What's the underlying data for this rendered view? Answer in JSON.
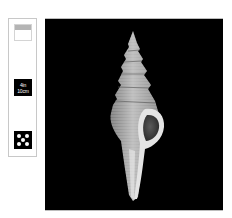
{
  "sidebar": {
    "items": [
      {
        "name": "view-thumbnail",
        "label": "",
        "icon": "image-view-icon"
      },
      {
        "name": "scale-toggle",
        "label_line1": "4in",
        "label_line2": "10cm",
        "icon": "scale-icon"
      },
      {
        "name": "zoom-toggle",
        "label": "",
        "icon": "dots-pattern-icon"
      }
    ]
  },
  "main": {
    "image_alt": "Spindle shell specimen on black background",
    "background_color": "#000000"
  },
  "colors": {
    "sidebar_border": "#c8c8c8",
    "thumb_band": "#b4b4b4",
    "shell_light": "#e6e6e6",
    "shell_mid": "#9a9a9a",
    "shell_dark": "#3a3a3a"
  }
}
